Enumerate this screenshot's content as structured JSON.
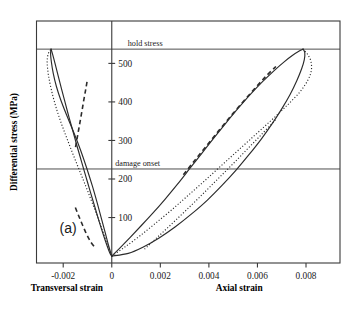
{
  "chart_data": {
    "type": "line",
    "title": "",
    "panel_label": "(a)",
    "xlabel_left": "Transversal strain",
    "xlabel_right": "Axial strain",
    "ylabel": "Differential stress (MPa)",
    "xlim": [
      -0.0031,
      0.0094
    ],
    "ylim": [
      -18,
      610
    ],
    "xticks": [
      -0.002,
      0,
      0.002,
      0.004,
      0.006,
      0.008
    ],
    "xticklabels": [
      "-0.002",
      "0",
      "0.002",
      "0.004",
      "0.006",
      "0.008"
    ],
    "yticks": [
      100,
      200,
      300,
      400,
      500
    ],
    "yticklabels": [
      "100",
      "200",
      "300",
      "400",
      "500"
    ],
    "grid": false,
    "legend": null,
    "annotations": [
      {
        "text": "hold stress",
        "y_value": 537,
        "type": "horizontal-reference-line"
      },
      {
        "text": "damage onset",
        "y_value": 226,
        "type": "horizontal-reference-line"
      }
    ],
    "series": [
      {
        "name": "axial-loading-solid",
        "style": "solid",
        "side": "axial",
        "points": [
          [
            0.0,
            0
          ],
          [
            0.00035,
            22
          ],
          [
            0.00075,
            48
          ],
          [
            0.0012,
            78
          ],
          [
            0.0017,
            112
          ],
          [
            0.0022,
            148
          ],
          [
            0.0027,
            186
          ],
          [
            0.0032,
            226
          ],
          [
            0.0037,
            266
          ],
          [
            0.0042,
            306
          ],
          [
            0.0047,
            345
          ],
          [
            0.0052,
            383
          ],
          [
            0.0057,
            419
          ],
          [
            0.0062,
            452
          ],
          [
            0.0067,
            482
          ],
          [
            0.0071,
            504
          ],
          [
            0.00745,
            521
          ],
          [
            0.00772,
            532
          ],
          [
            0.00788,
            537
          ]
        ]
      },
      {
        "name": "axial-unloading-solid",
        "style": "solid",
        "side": "axial",
        "points": [
          [
            0.00788,
            537
          ],
          [
            0.00795,
            528
          ],
          [
            0.00793,
            510
          ],
          [
            0.00782,
            486
          ],
          [
            0.00762,
            455
          ],
          [
            0.00735,
            420
          ],
          [
            0.007,
            382
          ],
          [
            0.0066,
            343
          ],
          [
            0.00615,
            303
          ],
          [
            0.00565,
            263
          ],
          [
            0.00512,
            223
          ],
          [
            0.00455,
            184
          ],
          [
            0.00395,
            146
          ],
          [
            0.0033,
            110
          ],
          [
            0.00262,
            76
          ],
          [
            0.00195,
            47
          ],
          [
            0.00128,
            23
          ],
          [
            0.00068,
            7
          ],
          [
            0.0,
            0
          ]
        ]
      },
      {
        "name": "axial-dotted",
        "style": "dotted",
        "side": "axial",
        "points": [
          [
            0.0,
            0
          ],
          [
            0.00055,
            24
          ],
          [
            0.00115,
            52
          ],
          [
            0.00178,
            84
          ],
          [
            0.00245,
            119
          ],
          [
            0.00312,
            156
          ],
          [
            0.0038,
            194
          ],
          [
            0.0045,
            234
          ],
          [
            0.0052,
            274
          ],
          [
            0.0059,
            314
          ],
          [
            0.00658,
            353
          ],
          [
            0.00722,
            391
          ],
          [
            0.00775,
            426
          ],
          [
            0.00808,
            457
          ],
          [
            0.00822,
            482
          ],
          [
            0.0082,
            506
          ],
          [
            0.00806,
            524
          ],
          [
            0.00788,
            537
          ]
        ]
      },
      {
        "name": "axial-dashed",
        "style": "dashed",
        "side": "axial",
        "points": [
          [
            0.00295,
            211
          ],
          [
            0.0034,
            247
          ],
          [
            0.0039,
            286
          ],
          [
            0.0044,
            325
          ],
          [
            0.0049,
            363
          ],
          [
            0.0054,
            400
          ],
          [
            0.00588,
            434
          ],
          [
            0.00634,
            466
          ],
          [
            0.00676,
            492
          ]
        ]
      },
      {
        "name": "axial-secondary-dotted",
        "style": "dotted",
        "side": "axial",
        "points": [
          [
            0.00135,
            18
          ],
          [
            0.0019,
            50
          ],
          [
            0.00248,
            84
          ],
          [
            0.00308,
            120
          ],
          [
            0.0037,
            158
          ],
          [
            0.00432,
            197
          ],
          [
            0.00494,
            236
          ],
          [
            0.00556,
            276
          ],
          [
            0.00616,
            315
          ],
          [
            0.00674,
            353
          ]
        ]
      },
      {
        "name": "transversal-loading-solid",
        "style": "solid",
        "side": "transversal",
        "points": [
          [
            0.0,
            0
          ],
          [
            -0.00012,
            25
          ],
          [
            -0.00026,
            58
          ],
          [
            -0.00042,
            96
          ],
          [
            -0.0006,
            138
          ],
          [
            -0.0008,
            182
          ],
          [
            -0.00103,
            228
          ],
          [
            -0.00128,
            274
          ],
          [
            -0.00156,
            320
          ],
          [
            -0.00186,
            366
          ],
          [
            -0.0021,
            405
          ],
          [
            -0.00228,
            440
          ],
          [
            -0.00241,
            474
          ],
          [
            -0.00249,
            505
          ],
          [
            -0.00252,
            525
          ],
          [
            -0.0025,
            537
          ]
        ]
      },
      {
        "name": "transversal-unloading-solid",
        "style": "solid",
        "side": "transversal",
        "points": [
          [
            -0.0025,
            537
          ],
          [
            -0.00243,
            522
          ],
          [
            -0.00233,
            498
          ],
          [
            -0.00221,
            468
          ],
          [
            -0.00207,
            434
          ],
          [
            -0.00192,
            398
          ],
          [
            -0.00176,
            360
          ],
          [
            -0.00159,
            322
          ],
          [
            -0.00142,
            283
          ],
          [
            -0.00124,
            244
          ],
          [
            -0.00106,
            205
          ],
          [
            -0.00088,
            166
          ],
          [
            -0.0007,
            128
          ],
          [
            -0.00053,
            92
          ],
          [
            -0.00036,
            58
          ],
          [
            -0.0002,
            28
          ],
          [
            -8e-05,
            8
          ],
          [
            0.0,
            0
          ]
        ]
      },
      {
        "name": "transversal-dotted",
        "style": "dotted",
        "side": "transversal",
        "points": [
          [
            0.0,
            0
          ],
          [
            -0.00018,
            30
          ],
          [
            -0.00038,
            66
          ],
          [
            -0.0006,
            104
          ],
          [
            -0.00084,
            144
          ],
          [
            -0.0011,
            186
          ],
          [
            -0.00136,
            227
          ],
          [
            -0.00162,
            268
          ],
          [
            -0.00187,
            309
          ],
          [
            -0.00211,
            350
          ],
          [
            -0.00232,
            391
          ],
          [
            -0.00249,
            432
          ],
          [
            -0.00261,
            470
          ],
          [
            -0.00266,
            502
          ],
          [
            -0.00262,
            524
          ],
          [
            -0.0025,
            537
          ]
        ]
      },
      {
        "name": "transversal-dashed",
        "style": "dashed",
        "side": "transversal",
        "points": [
          [
            -0.00102,
            452
          ],
          [
            -0.00108,
            430
          ],
          [
            -0.00116,
            402
          ],
          [
            -0.00124,
            372
          ],
          [
            -0.00133,
            340
          ],
          [
            -0.00142,
            308
          ],
          [
            -0.0015,
            280
          ]
        ]
      },
      {
        "name": "transversal-lower-dashed",
        "style": "dashed",
        "side": "transversal",
        "points": [
          [
            -0.0015,
            126
          ],
          [
            -0.00136,
            104
          ],
          [
            -0.0012,
            80
          ],
          [
            -0.00104,
            57
          ],
          [
            -0.00086,
            36
          ],
          [
            -0.00066,
            20
          ]
        ]
      }
    ]
  },
  "colors": {
    "curve": "#2b2b2b",
    "axis": "#3a3a3a",
    "background": "#ffffff"
  }
}
